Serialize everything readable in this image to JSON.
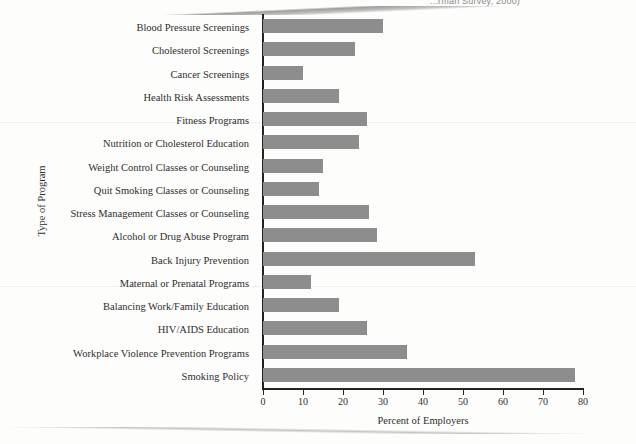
{
  "page": {
    "clipped_header_text": "...rman Survey, 2000)",
    "background_color": "#fdfdfc"
  },
  "chart_data": {
    "type": "bar",
    "orientation": "horizontal",
    "title": "",
    "xlabel": "Percent of Employers",
    "ylabel": "Type of Program",
    "xlim": [
      0,
      80
    ],
    "xticks": [
      0,
      10,
      20,
      30,
      40,
      50,
      60,
      70,
      80
    ],
    "grid": false,
    "legend": false,
    "bar_color": "#8d8d8d",
    "axis_color": "#232323",
    "categories": [
      "Blood Pressure Screenings",
      "Cholesterol Screenings",
      "Cancer Screenings",
      "Health Risk Assessments",
      "Fitness Programs",
      "Nutrition or Cholesterol Education",
      "Weight Control Classes or Counseling",
      "Quit Smoking Classes or Counseling",
      "Stress Management Classes or Counseling",
      "Alcohol or Drug Abuse Program",
      "Back Injury Prevention",
      "Maternal or Prenatal Programs",
      "Balancing Work/Family Education",
      "HIV/AIDS Education",
      "Workplace Violence Prevention Programs",
      "Smoking Policy"
    ],
    "values": [
      30,
      23,
      10,
      19,
      26,
      24,
      15,
      14,
      26.5,
      28.5,
      53,
      12,
      19,
      26,
      36,
      78
    ]
  }
}
